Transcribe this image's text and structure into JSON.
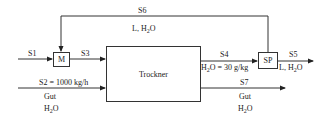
{
  "units": {
    "mixer": "M",
    "dryer": "Trockner",
    "splitter": "SP"
  },
  "streams": {
    "s1": {
      "label": "S1"
    },
    "s2": {
      "label": "S2 = 1000 kg/h",
      "components": [
        "Gut",
        "H2O"
      ]
    },
    "s3": {
      "label": "S3"
    },
    "s4": {
      "label": "S4",
      "spec": "H2O = 30 g/kg"
    },
    "s5": {
      "label": "S5",
      "components": "L, H2O"
    },
    "s6": {
      "label": "S6",
      "components": "L, H2O"
    },
    "s7": {
      "label": "S7",
      "components": [
        "Gut",
        "H2O"
      ]
    }
  },
  "colors": {
    "line": "#333333",
    "text": "#222222"
  }
}
